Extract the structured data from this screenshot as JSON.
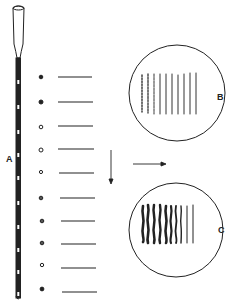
{
  "labels": {
    "pipette": "A",
    "field_b": "B",
    "field_c": "C"
  },
  "colors": {
    "ink": "#222222",
    "background": "#ffffff"
  },
  "figure": {
    "drop_count": 10,
    "smear_count": 10,
    "arrows": [
      "down-arrow",
      "right-arrow"
    ],
    "fields": [
      {
        "id": "B",
        "lines": 10,
        "style": "fine beaded lines"
      },
      {
        "id": "C",
        "lines": 10,
        "style": "thick wavy lines"
      }
    ]
  }
}
